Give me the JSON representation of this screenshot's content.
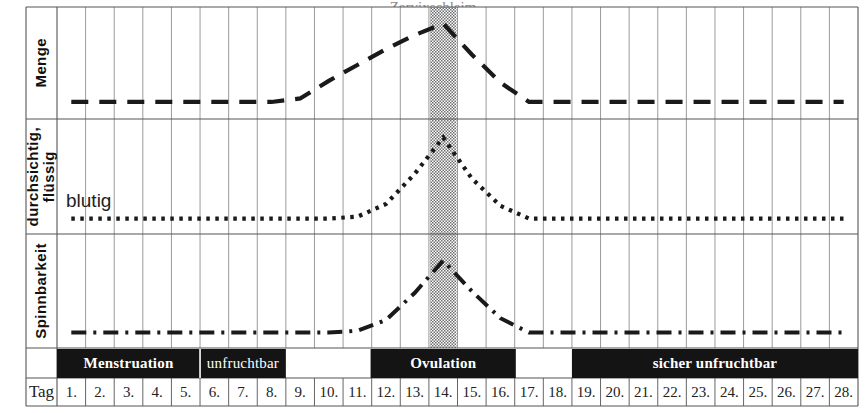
{
  "figure": {
    "title_cropped": "Zervixschleim",
    "background_color": "#ffffff",
    "line_color": "#1a1a1a",
    "grid_color": "#8f8f8f",
    "border_color": "#555555",
    "highlight_band_color": "#b8b8b8",
    "phase_bar_color": "#141414",
    "phase_bar_text_color": "#ffffff"
  },
  "row_labels": [
    {
      "key": "menge",
      "text": "Menge"
    },
    {
      "key": "durchsichtig",
      "text": "durchsichtig,\nflüssig"
    },
    {
      "key": "spinnbarkeit",
      "text": "Spinnbarkeit"
    }
  ],
  "annotations": [
    {
      "key": "blutig",
      "text": "blutig"
    }
  ],
  "axis": {
    "row_header_label": "Tag",
    "day_labels": [
      "1.",
      "2.",
      "3.",
      "4.",
      "5.",
      "6.",
      "7.",
      "8.",
      "9.",
      "10.",
      "11.",
      "12.",
      "13.",
      "14.",
      "15.",
      "16.",
      "17.",
      "18.",
      "19.",
      "20.",
      "21.",
      "22.",
      "23.",
      "24.",
      "25.",
      "26.",
      "27.",
      "28."
    ]
  },
  "phases": [
    {
      "key": "menstruation",
      "label": "Menstruation",
      "start_day": 1,
      "end_day": 5,
      "bold": true
    },
    {
      "key": "unfruchtbar",
      "label": "unfruchtbar",
      "start_day": 6,
      "end_day": 8,
      "bold": false
    },
    {
      "key": "ovulation",
      "label": "Ovulation",
      "start_day": 12,
      "end_day": 16,
      "bold": true
    },
    {
      "key": "sicher-unfruchtbar",
      "label": "sicher unfruchtbar",
      "start_day": 19,
      "end_day": 28,
      "bold": true
    }
  ],
  "highlight": {
    "label": "Ovulationstag",
    "day": 14
  },
  "chart_data": {
    "type": "line",
    "title": "Zervixschleim",
    "xlabel": "Tag",
    "ylabel": "",
    "x": [
      1,
      2,
      3,
      4,
      5,
      6,
      7,
      8,
      9,
      10,
      11,
      12,
      13,
      14,
      15,
      16,
      17,
      18,
      19,
      20,
      21,
      22,
      23,
      24,
      25,
      26,
      27,
      28
    ],
    "xlim": [
      1,
      28
    ],
    "grid": true,
    "legend_position": "none",
    "highlight_band_x": [
      14,
      14
    ],
    "series": [
      {
        "name": "Menge",
        "panel": 0,
        "dash": "dashed",
        "ylim": [
          0,
          1
        ],
        "values": [
          0.08,
          0.08,
          0.08,
          0.08,
          0.08,
          0.08,
          0.08,
          0.08,
          0.12,
          0.32,
          0.5,
          0.68,
          0.84,
          0.97,
          0.62,
          0.3,
          0.08,
          0.08,
          0.08,
          0.08,
          0.08,
          0.08,
          0.08,
          0.08,
          0.08,
          0.08,
          0.08,
          0.08
        ]
      },
      {
        "name": "durchsichtig, flüssig",
        "panel": 1,
        "dash": "dotted",
        "ylim": [
          0,
          1
        ],
        "values": [
          0.06,
          0.06,
          0.06,
          0.06,
          0.06,
          0.06,
          0.06,
          0.06,
          0.06,
          0.06,
          0.08,
          0.22,
          0.55,
          0.95,
          0.5,
          0.2,
          0.06,
          0.06,
          0.06,
          0.06,
          0.06,
          0.06,
          0.06,
          0.06,
          0.06,
          0.06,
          0.06,
          0.06
        ]
      },
      {
        "name": "Spinnbarkeit",
        "panel": 2,
        "dash": "dashdot",
        "ylim": [
          0,
          1
        ],
        "values": [
          0.06,
          0.06,
          0.06,
          0.06,
          0.06,
          0.06,
          0.06,
          0.06,
          0.06,
          0.06,
          0.08,
          0.2,
          0.5,
          0.86,
          0.52,
          0.22,
          0.06,
          0.06,
          0.06,
          0.06,
          0.06,
          0.06,
          0.06,
          0.06,
          0.06,
          0.06,
          0.06,
          0.06
        ]
      }
    ]
  }
}
